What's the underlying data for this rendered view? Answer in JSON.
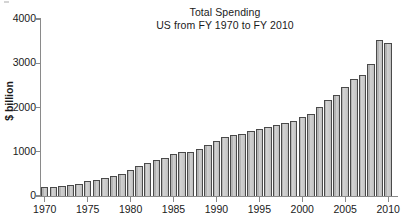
{
  "chart_data": {
    "type": "bar",
    "title": "Total Spending",
    "subtitle": "US from FY 1970 to FY 2010",
    "xlabel": "",
    "ylabel": "$ billion",
    "ylim": [
      0,
      4000
    ],
    "xlim": [
      1969.4,
      2010.6
    ],
    "grid": false,
    "legend": null,
    "ytick_labels": [
      "0",
      "1000",
      "2000",
      "3000",
      "4000"
    ],
    "ytick_values": [
      0,
      1000,
      2000,
      3000,
      4000
    ],
    "xtick_labels": [
      "1970",
      "1975",
      "1980",
      "1985",
      "1990",
      "1995",
      "2000",
      "2005",
      "2010"
    ],
    "xtick_values": [
      1970,
      1975,
      1980,
      1985,
      1990,
      1995,
      2000,
      2005,
      2010
    ],
    "categories": [
      "1970",
      "1971",
      "1972",
      "1973",
      "1974",
      "1975",
      "1976",
      "1977",
      "1978",
      "1979",
      "1980",
      "1981",
      "1982",
      "1983",
      "1984",
      "1985",
      "1986",
      "1987",
      "1988",
      "1989",
      "1990",
      "1991",
      "1992",
      "1993",
      "1994",
      "1995",
      "1996",
      "1997",
      "1998",
      "1999",
      "2000",
      "2001",
      "2002",
      "2003",
      "2004",
      "2005",
      "2006",
      "2007",
      "2008",
      "2009",
      "2010"
    ],
    "values": [
      196,
      210,
      231,
      246,
      269,
      332,
      372,
      409,
      459,
      504,
      591,
      678,
      746,
      808,
      852,
      946,
      990,
      1004,
      1064,
      1143,
      1253,
      1324,
      1382,
      1409,
      1462,
      1516,
      1560,
      1601,
      1653,
      1702,
      1789,
      1863,
      2011,
      2160,
      2293,
      2472,
      2655,
      2729,
      2983,
      3518,
      3456
    ],
    "bar_fill_color": "#c9c9c9",
    "bar_edge_color": "#4a4a4a",
    "axis_color": "#8a8a8a",
    "text_color": "#1a1a1a",
    "background_color": "#ffffff"
  }
}
